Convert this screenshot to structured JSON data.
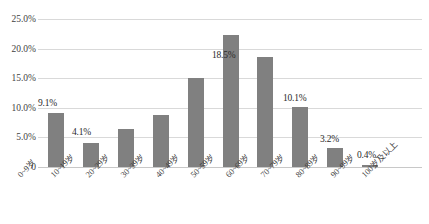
{
  "chart_data": {
    "type": "bar",
    "title": "",
    "subtitle": "",
    "xlabel": "",
    "ylabel": "",
    "categories": [
      "0~9岁",
      "10~19岁",
      "20~29岁",
      "30~39岁",
      "40~49岁",
      "50~59岁",
      "60~69岁",
      "70~79岁",
      "80~89岁",
      "90~99岁",
      "100岁及以上"
    ],
    "values": [
      9.1,
      4.1,
      6.5,
      8.8,
      15.0,
      22.3,
      18.5,
      10.1,
      3.2,
      0.4,
      0.0
    ],
    "value_labels": [
      "9.1%",
      "4.1%",
      "",
      "",
      "",
      "",
      "18.5%",
      "10.1%",
      "3.2%",
      "0.4%",
      ""
    ],
    "ylim": [
      0,
      25
    ],
    "ytick_labels": [
      "0",
      "5.0%",
      "10.0%",
      "15.0%",
      "20.0%",
      "25.0%"
    ],
    "ytick_values": [
      0,
      5,
      10,
      15,
      20,
      25
    ],
    "grid": true,
    "legend": false,
    "legend_position": "none",
    "series_color": "#808080",
    "gridline_color": "#D9D9D9",
    "text_color": "#3F3F3F"
  }
}
